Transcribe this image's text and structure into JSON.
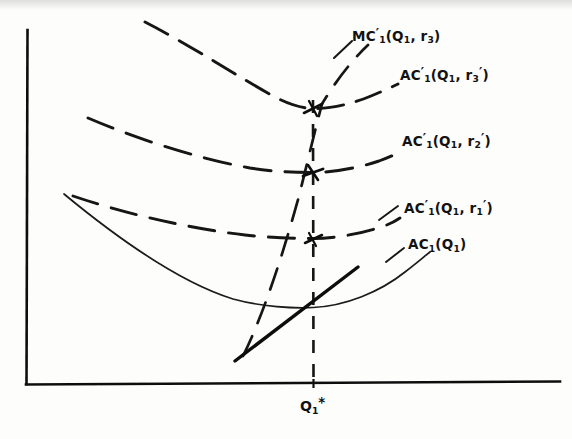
{
  "figure": {
    "kind": "economics-cost-curve-diagram",
    "background_color": "#fdfdfc",
    "ink_color": "#111111"
  },
  "axes": {
    "x_axis_name": "quantity-axis",
    "y_axis_name": "cost-axis",
    "x_tick_label_html": "Q<sub>1</sub><span class=\"star-mark\">*</span>",
    "x_tick_label_text": "Q1*"
  },
  "labels": [
    {
      "id": "mc-r3",
      "name": "label-mc-prime-q1-r3",
      "text": "MC'1(Q1, r3)",
      "html": "MC<span class=\"prime\">&#8242;</span><sub>1</sub>(Q<sub>1</sub>, r<sub>3</sub>)",
      "x": 352,
      "y": 27,
      "style": "dashed",
      "role": "marginal-cost-curve-label"
    },
    {
      "id": "ac-r3",
      "name": "label-ac-prime-q1-r3-prime",
      "text": "AC'1(Q1, r'3)",
      "html": "AC<span class=\"prime\">&#8242;</span><sub>1</sub>(Q<sub>1</sub>, r<sub>3</sub><span class=\"prime\">&#8242;</span>)",
      "x": 400,
      "y": 66,
      "style": "dashed",
      "role": "average-cost-curve-label"
    },
    {
      "id": "ac-r2",
      "name": "label-ac-prime-q1-r2-prime",
      "text": "AC'1(Q1, r'2)",
      "html": "AC<span class=\"prime\">&#8242;</span><sub>1</sub>(Q<sub>1</sub>, r<sub>2</sub><span class=\"prime\">&#8242;</span>)",
      "x": 402,
      "y": 132,
      "style": "dashed",
      "role": "average-cost-curve-label"
    },
    {
      "id": "ac-r1",
      "name": "label-ac-prime-q1-r1-prime",
      "text": "AC'1(Q1, r'1)",
      "html": "AC<span class=\"prime\">&#8242;</span><sub>1</sub>(Q<sub>1</sub>, r<sub>1</sub><span class=\"prime\">&#8242;</span>)",
      "x": 404,
      "y": 199,
      "style": "dashed",
      "role": "average-cost-curve-label"
    },
    {
      "id": "ac-base",
      "name": "label-ac-q1",
      "text": "AC1(Q1)",
      "html": "AC<sub>1</sub>(Q<sub>1</sub>)",
      "x": 408,
      "y": 238,
      "style": "solid",
      "role": "average-cost-curve-label"
    }
  ],
  "chart_data": {
    "type": "line",
    "title": "",
    "xlabel": "",
    "ylabel": "",
    "grid": false,
    "legend_position": "inline-right",
    "axis_pixels": {
      "origin_x": 27,
      "origin_y": 384,
      "x_axis_end_x": 560,
      "x_axis_end_y": 382,
      "y_axis_top_y": 30
    },
    "optimal_quantity_marker": {
      "label": "Q1*",
      "x_pixel": 313,
      "style": "dashed-vertical",
      "from_y": 100,
      "to_y": 385
    },
    "series": [
      {
        "name": "AC'1(Q1, r'3)",
        "style": "dashed",
        "minimum_point": [
          313,
          108
        ],
        "left_end": [
          145,
          22
        ],
        "right_end": [
          398,
          84
        ],
        "tangency_marker": true
      },
      {
        "name": "AC'1(Q1, r'2)",
        "style": "dashed",
        "minimum_point": [
          313,
          172
        ],
        "left_end": [
          88,
          118
        ],
        "right_end": [
          400,
          152
        ],
        "tangency_marker": true
      },
      {
        "name": "AC'1(Q1, r'1)",
        "style": "dashed",
        "minimum_point": [
          313,
          238
        ],
        "left_end": [
          73,
          196
        ],
        "right_end": [
          400,
          218
        ],
        "tangency_marker": true
      },
      {
        "name": "AC1(Q1)",
        "style": "solid",
        "minimum_point": [
          313,
          307
        ],
        "left_end": [
          64,
          194
        ],
        "right_end": [
          430,
          252
        ],
        "tangency_marker": false
      },
      {
        "name": "MC'1(Q1, r3)",
        "style": "dashed",
        "description": "upward-sloping dashed marginal cost locus through the AC' minima",
        "lower_end": [
          243,
          355
        ],
        "upper_end": [
          368,
          45
        ]
      },
      {
        "name": "MC1(Q1)",
        "style": "solid-thick",
        "description": "upward-sloping solid marginal cost line through the AC1 minimum",
        "lower_end": [
          235,
          360
        ],
        "upper_end": [
          358,
          268
        ]
      }
    ]
  }
}
